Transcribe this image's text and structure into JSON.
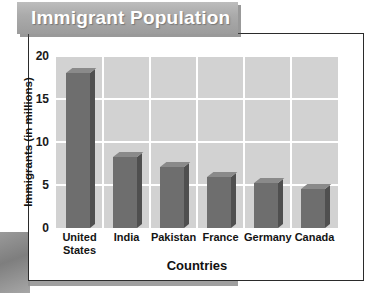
{
  "banner": {
    "title": "Immigrant Population"
  },
  "chart_data": {
    "type": "bar",
    "title": "Immigrant Population",
    "xlabel": "Countries",
    "ylabel": "Immigrants (in millions)",
    "categories": [
      "United States",
      "India",
      "Pakistan",
      "France",
      "Germany",
      "Canada"
    ],
    "values": [
      18.0,
      8.2,
      7.1,
      5.9,
      5.2,
      4.5
    ],
    "ylim": [
      0,
      20
    ],
    "yticks": [
      "0",
      "5",
      "10",
      "15",
      "20"
    ],
    "ytick_values": [
      0,
      5,
      10,
      15,
      20
    ],
    "grid": true,
    "legend": "none",
    "colors": {
      "bar_front": "#6e6e6e",
      "bar_side": "#4f4f4f",
      "bar_top": "#8a8a8a",
      "plot_background": "#d2d2d2",
      "gridline": "#ffffff",
      "banner_background": "#a8a8a8",
      "banner_text": "#ffffff",
      "panel_background": "#ffffff",
      "axis_text": "#141414"
    }
  }
}
